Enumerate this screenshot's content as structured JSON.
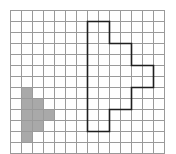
{
  "diagram": {
    "type": "grid-shapes",
    "grid": {
      "columns": 14,
      "rows": 13,
      "cell_size": 11,
      "origin_x": 10,
      "origin_y": 10,
      "line_color": "#9a9a9a"
    },
    "shaded_shape": {
      "fill_color": "#a9a9a9",
      "cells": [
        [
          1,
          7
        ],
        [
          1,
          8
        ],
        [
          1,
          9
        ],
        [
          1,
          10
        ],
        [
          1,
          11
        ],
        [
          2,
          8
        ],
        [
          2,
          9
        ],
        [
          2,
          10
        ],
        [
          3,
          9
        ]
      ]
    },
    "outlined_shape": {
      "stroke_color": "#1e1e1e",
      "vertices": [
        [
          7,
          1
        ],
        [
          9,
          1
        ],
        [
          9,
          3
        ],
        [
          11,
          3
        ],
        [
          11,
          5
        ],
        [
          13,
          5
        ],
        [
          13,
          7
        ],
        [
          11,
          7
        ],
        [
          11,
          9
        ],
        [
          9,
          9
        ],
        [
          9,
          11
        ],
        [
          7,
          11
        ]
      ]
    }
  }
}
